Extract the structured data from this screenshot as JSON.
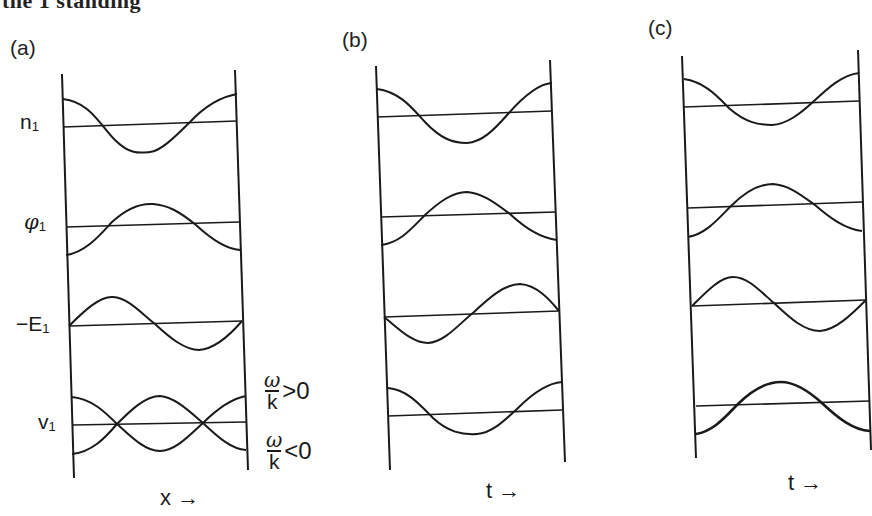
{
  "header": {
    "partial_text": "the 1 standing"
  },
  "panels": [
    {
      "id": "a",
      "label": "(a)",
      "axis_label": "x",
      "axis_arrow": "→"
    },
    {
      "id": "b",
      "label": "(b)",
      "axis_label": "t",
      "axis_arrow": "→"
    },
    {
      "id": "c",
      "label": "(c)",
      "axis_label": "t",
      "axis_arrow": "→"
    }
  ],
  "rows": [
    {
      "symbol": "n",
      "subscript": "1",
      "prefix": ""
    },
    {
      "symbol": "φ",
      "subscript": "1",
      "prefix": ""
    },
    {
      "symbol": "E",
      "subscript": "1",
      "prefix": "−"
    },
    {
      "symbol": "v",
      "subscript": "1",
      "prefix": ""
    }
  ],
  "annotations": {
    "positive": {
      "num": "ω",
      "den": "k",
      "relation": ">0"
    },
    "negative": {
      "num": "ω",
      "den": "k",
      "relation": "<0"
    }
  },
  "colors": {
    "ink": "#1a1a1a",
    "background": "#ffffff"
  }
}
